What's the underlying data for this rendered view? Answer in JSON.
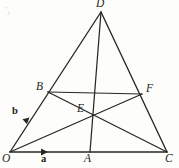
{
  "figure": {
    "kind": "geometry-diagram",
    "canvas": {
      "width": 179,
      "height": 168
    },
    "background_color": "#fdfdfc",
    "stroke_color": "#272724",
    "points": [
      {
        "id": "O",
        "label": "O",
        "x": 10,
        "y": 152,
        "label_x": 2,
        "label_y": 154
      },
      {
        "id": "A",
        "label": "A",
        "x": 90,
        "y": 152,
        "label_x": 85,
        "label_y": 154
      },
      {
        "id": "C",
        "label": "C",
        "x": 167,
        "y": 152,
        "label_x": 166,
        "label_y": 154
      },
      {
        "id": "D",
        "label": "D",
        "x": 101,
        "y": 12,
        "label_x": 97,
        "label_y": 0
      },
      {
        "id": "B",
        "label": "B",
        "x": 48,
        "y": 92,
        "label_x": 36,
        "label_y": 82
      },
      {
        "id": "F",
        "label": "F",
        "x": 142,
        "y": 94,
        "label_x": 147,
        "label_y": 84
      },
      {
        "id": "E",
        "label": "E",
        "x": 90,
        "y": 117,
        "label_x": 78,
        "label_y": 104
      }
    ],
    "segments": [
      {
        "id": "OD",
        "from": "O",
        "to": "D",
        "role": "edge"
      },
      {
        "id": "DC",
        "from": "D",
        "to": "C",
        "role": "edge"
      },
      {
        "id": "OC",
        "from": "O",
        "to": "C",
        "role": "baseline"
      },
      {
        "id": "DA",
        "from": "D",
        "to": "A",
        "role": "cevian"
      },
      {
        "id": "OF",
        "from": "O",
        "to": "F",
        "role": "cevian"
      },
      {
        "id": "CB",
        "from": "C",
        "to": "B",
        "role": "cevian"
      },
      {
        "id": "BF",
        "from": "B",
        "to": "F",
        "role": "cevian"
      }
    ],
    "vectors": [
      {
        "id": "a",
        "label": "a",
        "along": "OC",
        "tip_x": 47,
        "tip_y": 152,
        "label_x": 41,
        "label_y": 155
      },
      {
        "id": "b",
        "label": "b",
        "along": "OD",
        "tip_x": 28,
        "tip_y": 120,
        "label_x": 13,
        "label_y": 107
      }
    ],
    "corner_mark": "'₁"
  }
}
